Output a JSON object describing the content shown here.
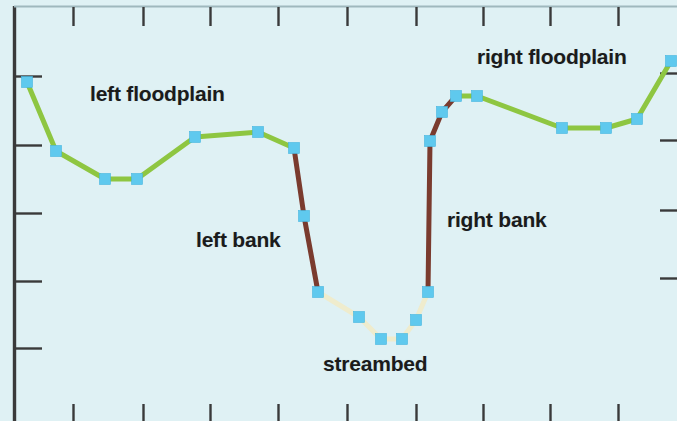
{
  "figure": {
    "background_color": "#dff1f4",
    "width": 677,
    "height": 421,
    "axis_color": "#3a3a3a"
  },
  "annotations": [
    {
      "key": "left_floodplain",
      "text": "left floodplain",
      "x": 90,
      "y": 82
    },
    {
      "key": "right_floodplain",
      "text": "right floodplain",
      "x": 477,
      "y": 45
    },
    {
      "key": "left_bank",
      "text": "left bank",
      "x": 196,
      "y": 228
    },
    {
      "key": "right_bank",
      "text": "right bank",
      "x": 447,
      "y": 208
    },
    {
      "key": "streambed",
      "text": "streambed",
      "x": 323,
      "y": 352
    }
  ],
  "chart_data": {
    "type": "line",
    "title": "",
    "subtitle": "",
    "xlabel": "",
    "ylabel": "",
    "grid": false,
    "legend_position": "none",
    "axes": {
      "xlim": [
        0,
        677
      ],
      "ylim": [
        421,
        0
      ],
      "x_ticks_top_px": [
        73,
        143,
        210,
        278,
        347,
        416,
        483,
        550,
        618
      ],
      "x_ticks_bottom_px": [
        73,
        143,
        210,
        278,
        347,
        416,
        483,
        550,
        618
      ],
      "y_ticks_left_px": [
        76,
        145,
        213,
        281,
        348
      ],
      "y_ticks_right_px": [
        73,
        140,
        210,
        278
      ],
      "tick_labels_x": [],
      "tick_labels_y": []
    },
    "marker": {
      "shape": "square",
      "color": "#5fc9ee",
      "size_px": 11
    },
    "segments": [
      {
        "name": "left floodplain",
        "color": "#8ec641",
        "width_px": 5,
        "points": [
          [
            27,
            82
          ],
          [
            56,
            151
          ],
          [
            105,
            179
          ],
          [
            137,
            179
          ],
          [
            195,
            137
          ],
          [
            258,
            132
          ],
          [
            294,
            148
          ]
        ]
      },
      {
        "name": "left bank",
        "color": "#7a3b2e",
        "width_px": 5,
        "points": [
          [
            294,
            148
          ],
          [
            304,
            216
          ],
          [
            318,
            292
          ]
        ]
      },
      {
        "name": "streambed",
        "color": "#efeccd",
        "width_px": 5,
        "points": [
          [
            318,
            292
          ],
          [
            359,
            317
          ],
          [
            381,
            339
          ],
          [
            402,
            339
          ],
          [
            416,
            320
          ],
          [
            428,
            292
          ]
        ]
      },
      {
        "name": "right bank",
        "color": "#7a3b2e",
        "width_px": 5,
        "points": [
          [
            428,
            292
          ],
          [
            430,
            141
          ],
          [
            442,
            112
          ],
          [
            456,
            96
          ]
        ]
      },
      {
        "name": "right floodplain",
        "color": "#8ec641",
        "width_px": 5,
        "points": [
          [
            456,
            96
          ],
          [
            477,
            96
          ],
          [
            562,
            128
          ],
          [
            606,
            128
          ],
          [
            637,
            119
          ],
          [
            671,
            61
          ]
        ]
      }
    ],
    "all_points": [
      [
        27,
        82
      ],
      [
        56,
        151
      ],
      [
        105,
        179
      ],
      [
        137,
        179
      ],
      [
        195,
        137
      ],
      [
        258,
        132
      ],
      [
        294,
        148
      ],
      [
        304,
        216
      ],
      [
        318,
        292
      ],
      [
        359,
        317
      ],
      [
        381,
        339
      ],
      [
        402,
        339
      ],
      [
        416,
        320
      ],
      [
        428,
        292
      ],
      [
        430,
        141
      ],
      [
        442,
        112
      ],
      [
        456,
        96
      ],
      [
        477,
        96
      ],
      [
        562,
        128
      ],
      [
        606,
        128
      ],
      [
        637,
        119
      ],
      [
        671,
        61
      ]
    ]
  }
}
